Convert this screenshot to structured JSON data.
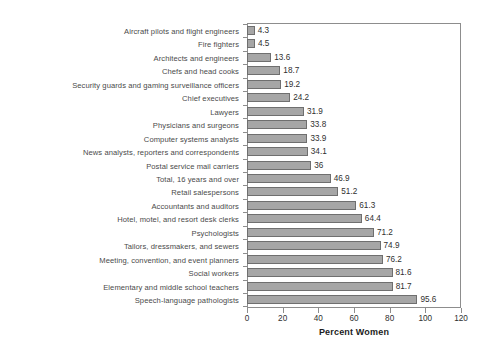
{
  "chart_data": {
    "type": "bar",
    "orientation": "horizontal",
    "title": "",
    "xlabel": "Percent Women",
    "ylabel": "",
    "xlim": [
      0,
      120
    ],
    "xticks": [
      0,
      20,
      40,
      60,
      80,
      100,
      120
    ],
    "grid": false,
    "legend": null,
    "bar_color": "#a6a6a6",
    "bar_border_color": "#6f6f6f",
    "categories": [
      "Aircraft pilots and flight engineers",
      "Fire fighters",
      "Architects and engineers",
      "Chefs and head cooks",
      "Security guards and gaming surveillance officers",
      "Chief executives",
      "Lawyers",
      "Physicians and surgeons",
      "Computer systems analysts",
      "News analysts, reporters and correspondents",
      "Postal service mail carriers",
      "Total, 16 years and over",
      "Retail salespersons",
      "Accountants and auditors",
      "Hotel, motel, and resort desk clerks",
      "Psychologists",
      "Tailors, dressmakers, and sewers",
      "Meeting, convention, and event planners",
      "Social workers",
      "Elementary and middle school teachers",
      "Speech-language pathologists"
    ],
    "values": [
      4.3,
      4.5,
      13.6,
      18.7,
      19.2,
      24.2,
      31.9,
      33.8,
      33.9,
      34.1,
      36,
      46.9,
      51.2,
      61.3,
      64.4,
      71.2,
      74.9,
      76.2,
      81.6,
      81.7,
      95.6
    ],
    "value_labels": [
      "4.3",
      "4.5",
      "13.6",
      "18.7",
      "19.2",
      "24.2",
      "31.9",
      "33.8",
      "33.9",
      "34.1",
      "36",
      "46.9",
      "51.2",
      "61.3",
      "64.4",
      "71.2",
      "74.9",
      "76.2",
      "81.6",
      "81.7",
      "95.6"
    ],
    "tick_labels": [
      "0",
      "20",
      "40",
      "60",
      "80",
      "100",
      "120"
    ]
  }
}
